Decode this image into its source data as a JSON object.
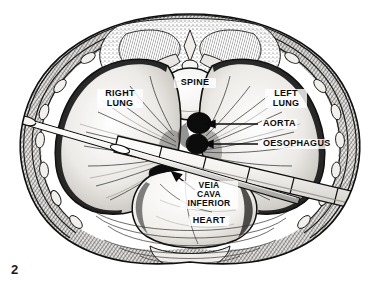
{
  "figure": {
    "number": "2",
    "kind": "anatomical-cross-section",
    "background_color": "#ffffff",
    "ink_color": "#111111"
  },
  "labels": {
    "spine": "SPINE",
    "right_lung": "RIGHT\nLUNG",
    "left_lung": "LEFT\nLUNG",
    "aorta": "AORTA",
    "oesophagus": "OESOPHAGUS",
    "vena_cava": "VEIA\nCAVA\nINFERIOR",
    "heart": "HEART"
  },
  "structures": [
    {
      "name": "spine",
      "label": "SPINE",
      "fill": "#f2f0ec",
      "shape": "vertebral-body"
    },
    {
      "name": "right-lung",
      "label": "RIGHT LUNG",
      "fill": "#e8e6e2",
      "shape": "lung-field"
    },
    {
      "name": "left-lung",
      "label": "LEFT LUNG",
      "fill": "#e8e6e2",
      "shape": "lung-field"
    },
    {
      "name": "aorta",
      "label": "AORTA",
      "fill": "#0d0d0d",
      "shape": "oval-vessel"
    },
    {
      "name": "oesophagus",
      "label": "OESOPHAGUS",
      "fill": "#0d0d0d",
      "shape": "oval-vessel"
    },
    {
      "name": "vena-cava-inferior",
      "label": "VEIA CAVA INFERIOR",
      "fill": "#0d0d0d",
      "shape": "crescent-vessel"
    },
    {
      "name": "heart",
      "label": "HEART",
      "fill": "#f4f2ef",
      "shape": "rounded-mass"
    },
    {
      "name": "chest-wall",
      "label": "",
      "fill": "#cfccc7",
      "shape": "ring"
    },
    {
      "name": "needle",
      "label": "",
      "fill": "#fbfbfa",
      "shape": "thin-probe"
    },
    {
      "name": "graduated-instrument",
      "label": "",
      "fill": "#f6f5f3",
      "shape": "wide-band"
    }
  ],
  "leaders": [
    {
      "name": "aorta-leader",
      "from_label": "AORTA",
      "to_structure": "aorta"
    },
    {
      "name": "oesophagus-leader",
      "from_label": "OESOPHAGUS",
      "to_structure": "oesophagus"
    },
    {
      "name": "vena-cava-leader",
      "from_label": "VEIA CAVA INFERIOR",
      "to_structure": "vena-cava-inferior"
    }
  ]
}
